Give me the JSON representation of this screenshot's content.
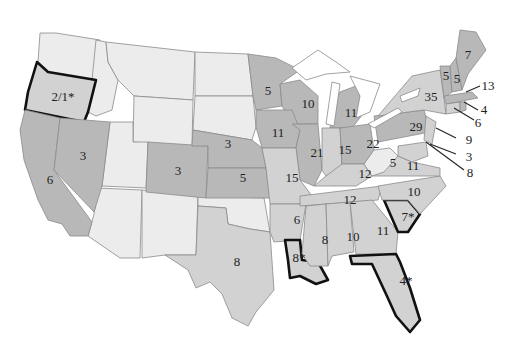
{
  "map": {
    "type": "choropleth",
    "region": "Contiguous United States",
    "shading_levels": {
      "none": "#ececec",
      "light": "#d2d2d2",
      "dark": "#b8b8b8"
    },
    "highlight_outline": "#111111",
    "note": "Asterisk (*) marks states with bold outline"
  },
  "labels": {
    "OR": "2/1*",
    "NV": "3",
    "CA": "6",
    "CO": "3",
    "NE": "3",
    "KS": "5",
    "MN": "5",
    "WI": "10",
    "IA": "11",
    "IL": "21",
    "MO": "15",
    "MI": "11",
    "IN": "15",
    "OH": "22",
    "KY": "12",
    "TN": "12",
    "WV": "5",
    "VA": "11",
    "NC": "10",
    "SC": "7*",
    "GA": "11",
    "AL": "10",
    "MS": "8",
    "AR": "6",
    "LA": "8*",
    "FL": "4*",
    "TX": "8",
    "PA": "29",
    "NY": "35",
    "VT": "5",
    "NH": "5",
    "ME": "7",
    "MA": "13",
    "RI": "4",
    "CT": "6",
    "NJ": "9",
    "DE": "3",
    "MD": "8"
  }
}
